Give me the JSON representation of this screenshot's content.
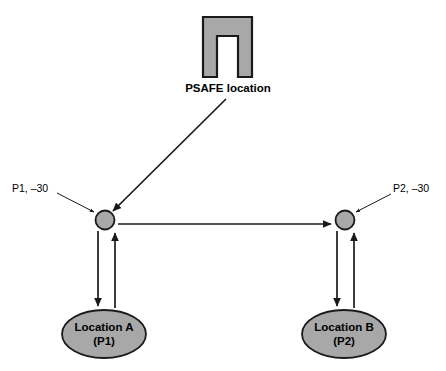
{
  "diagram": {
    "background_color": "#ffffff",
    "shape_fill_color": "#a8a8a8",
    "shape_stroke_color": "#1a1a1a",
    "line_color": "#1a1a1a",
    "text_color": "#000000",
    "psafe": {
      "label": "PSAFE location",
      "icon_name": "psafe-arch-shape"
    },
    "nodes": [
      {
        "id": "p1",
        "label": "P1, –30",
        "ellipse_line1": "Location A",
        "ellipse_line2": "(P1)"
      },
      {
        "id": "p2",
        "label": "P2, –30",
        "ellipse_line1": "Location B",
        "ellipse_line2": "(P2)"
      }
    ]
  }
}
